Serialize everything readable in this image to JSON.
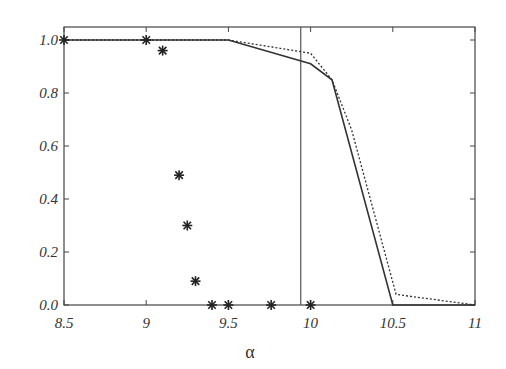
{
  "chart_data": {
    "type": "line",
    "title": "",
    "xlabel": "α",
    "ylabel": "",
    "xlim": [
      8.5,
      11
    ],
    "ylim": [
      0,
      1.05
    ],
    "x_ticks": [
      "8.5",
      "9",
      "9.5",
      "10",
      "10.5",
      "11"
    ],
    "y_ticks": [
      "0.0",
      "0.2",
      "0.4",
      "0.6",
      "0.8",
      "1.0"
    ],
    "grid": false,
    "legend": null,
    "vertical_line": {
      "x": 9.94
    },
    "series": [
      {
        "name": "solid",
        "style": "solid",
        "x": [
          8.5,
          9.5,
          10.0,
          10.13,
          10.5,
          11.0
        ],
        "y": [
          1.0,
          1.0,
          0.91,
          0.85,
          0.0,
          0.0
        ]
      },
      {
        "name": "dotted",
        "style": "dotted",
        "x": [
          8.5,
          9.5,
          10.0,
          10.13,
          10.25,
          10.52,
          11.0
        ],
        "y": [
          1.0,
          1.0,
          0.95,
          0.85,
          0.66,
          0.04,
          0.0
        ]
      },
      {
        "name": "stars",
        "style": "markers",
        "marker": "asterisk",
        "x": [
          8.5,
          9.0,
          9.1,
          9.2,
          9.25,
          9.3,
          9.4,
          9.5,
          9.76,
          10.0
        ],
        "y": [
          1.0,
          1.0,
          0.96,
          0.49,
          0.3,
          0.09,
          0.0,
          0.0,
          0.0,
          0.0
        ]
      }
    ]
  }
}
